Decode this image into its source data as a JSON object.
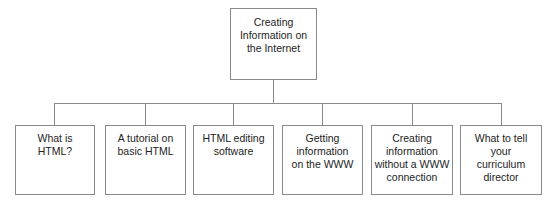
{
  "diagram": {
    "type": "hierarchy-tree",
    "orientation": "top-down",
    "line_color": "#8a8a8a",
    "background_color": "#ffffff",
    "text_color": "#232323",
    "root": {
      "label": "Creating\nInformation on\nthe Internet",
      "lines": [
        "Creating",
        "Information on",
        "the Internet"
      ]
    },
    "children": [
      {
        "label": "What is\nHTML?",
        "lines": [
          "What is",
          "HTML?"
        ]
      },
      {
        "label": "A tutorial on\nbasic HTML",
        "lines": [
          "A tutorial on",
          "basic HTML"
        ]
      },
      {
        "label": "HTML editing\nsoftware",
        "lines": [
          "HTML editing",
          "software"
        ]
      },
      {
        "label": "Getting\ninformation\non the WWW",
        "lines": [
          "Getting",
          "information",
          "on the WWW"
        ]
      },
      {
        "label": "Creating\ninformation\nwithout a WWW\nconnection",
        "lines": [
          "Creating",
          "information",
          "without a WWW",
          "connection"
        ]
      },
      {
        "label": "What to tell\nyour\ncurriculum\ndirector",
        "lines": [
          "What to tell",
          "your",
          "curriculum",
          "director"
        ]
      }
    ]
  }
}
